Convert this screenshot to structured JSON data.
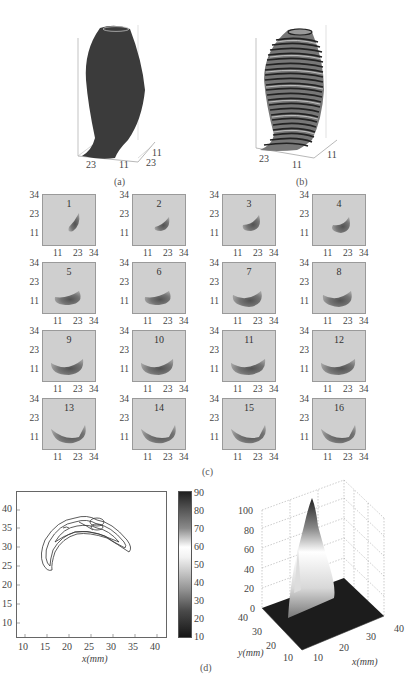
{
  "figure_a": {
    "caption": "(a)",
    "axis_ticks": [
      "23",
      "11",
      "11",
      "23"
    ]
  },
  "figure_b": {
    "caption": "(b)",
    "axis_ticks": [
      "23",
      "11",
      "11"
    ]
  },
  "figure_c": {
    "caption": "(c)",
    "y_ticks": [
      "34",
      "23",
      "11"
    ],
    "x_ticks": [
      "11",
      "23",
      "34"
    ],
    "panels": [
      {
        "label": "1"
      },
      {
        "label": "2"
      },
      {
        "label": "3"
      },
      {
        "label": "4"
      },
      {
        "label": "5"
      },
      {
        "label": "6"
      },
      {
        "label": "7"
      },
      {
        "label": "8"
      },
      {
        "label": "9"
      },
      {
        "label": "10"
      },
      {
        "label": "11"
      },
      {
        "label": "12"
      },
      {
        "label": "13"
      },
      {
        "label": "14"
      },
      {
        "label": "15"
      },
      {
        "label": "16"
      }
    ]
  },
  "figure_d": {
    "caption": "(d)",
    "contour": {
      "xlabel": "x(mm)",
      "x_ticks": [
        "10",
        "15",
        "20",
        "25",
        "30",
        "35",
        "40"
      ],
      "y_ticks": [
        "40",
        "35",
        "30",
        "25",
        "20",
        "15",
        "10"
      ]
    },
    "colorbar": {
      "ticks": [
        "90",
        "80",
        "70",
        "60",
        "50",
        "40",
        "30",
        "20",
        "10"
      ]
    },
    "surface": {
      "z_ticks": [
        "100",
        "80",
        "60",
        "40",
        "20",
        "0"
      ],
      "y_ticks": [
        "40",
        "30",
        "20",
        "10"
      ],
      "x_ticks": [
        "10",
        "20",
        "30",
        "40"
      ],
      "ylabel": "y(mm)",
      "xlabel": "x(mm)"
    }
  },
  "chart_data": [
    {
      "type": "heatmap",
      "title": "(c) 16 slice intensity maps",
      "xlabel": "",
      "ylabel": "",
      "x_ticks": [
        11,
        23,
        34
      ],
      "y_ticks": [
        11,
        23,
        34
      ],
      "panels": 16
    },
    {
      "type": "contour",
      "title": "(d) contour map",
      "xlabel": "x(mm)",
      "ylabel": "",
      "xlim": [
        8,
        42
      ],
      "ylim": [
        8,
        42
      ],
      "x_ticks": [
        10,
        15,
        20,
        25,
        30,
        35,
        40
      ],
      "y_ticks": [
        10,
        15,
        20,
        25,
        30,
        35,
        40
      ],
      "colorbar": {
        "range": [
          10,
          90
        ],
        "ticks": [
          10,
          20,
          30,
          40,
          50,
          60,
          70,
          80,
          90
        ]
      }
    },
    {
      "type": "surface",
      "title": "(d) 3D surface",
      "xlabel": "x(mm)",
      "ylabel": "y(mm)",
      "zlabel": "",
      "xlim": [
        10,
        40
      ],
      "ylim": [
        10,
        40
      ],
      "zlim": [
        0,
        100
      ],
      "z_ticks": [
        0,
        20,
        40,
        60,
        80,
        100
      ],
      "peak_value": 100
    }
  ]
}
